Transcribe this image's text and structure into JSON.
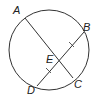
{
  "diagram": {
    "type": "circle-chords",
    "circle": {
      "cx": 49,
      "cy": 50,
      "r": 40
    },
    "points": {
      "A": {
        "label": "A",
        "x": 25,
        "y": 18,
        "label_x": 13,
        "label_y": 14
      },
      "B": {
        "label": "B",
        "x": 84,
        "y": 32,
        "label_x": 84,
        "label_y": 31
      },
      "C": {
        "label": "C",
        "x": 73,
        "y": 78,
        "label_x": 75,
        "label_y": 87
      },
      "D": {
        "label": "D",
        "x": 37,
        "y": 86,
        "label_x": 27,
        "label_y": 93
      },
      "E": {
        "label": "E",
        "x": 60,
        "y": 58,
        "label_x": 46,
        "label_y": 63
      }
    },
    "segments": [
      {
        "from": "A",
        "to": "C"
      },
      {
        "from": "B",
        "to": "D"
      }
    ],
    "congruence_marks": [
      "BE",
      "ED"
    ],
    "stroke_color": "#333333"
  }
}
